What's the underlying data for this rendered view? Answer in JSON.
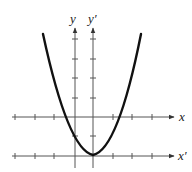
{
  "diagram": {
    "type": "coordinate translation of parabola",
    "axes": {
      "x_label": "x",
      "y_label": "y",
      "x_prime_label": "x′",
      "y_prime_label": "y′"
    },
    "curve": {
      "kind": "parabola",
      "opens": "up",
      "vertex_note": "vertex at origin of x′y′ system"
    },
    "colors": {
      "curve": "#111111",
      "axis": "#444444",
      "background": "#ffffff"
    }
  }
}
